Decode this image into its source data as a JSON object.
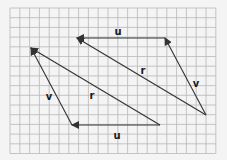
{
  "diagram": {
    "title": "",
    "grid": {
      "x": 10,
      "y": 8,
      "cols": 21,
      "rows": 15,
      "cell_w": 9.8,
      "cell_h": 9.7,
      "color": "#b8b8b8"
    },
    "colors": {
      "background": "#f4f4f4",
      "stroke": "#333333",
      "label": "#1a1a1a"
    },
    "vectors": [
      {
        "id": "u-top",
        "label": "u",
        "from": [
          165,
          38
        ],
        "to": [
          77,
          38
        ],
        "label_pos": [
          118,
          35
        ]
      },
      {
        "id": "r-top",
        "label": "r",
        "from": [
          206,
          115
        ],
        "to": [
          77,
          38
        ],
        "label_pos": [
          143,
          74
        ]
      },
      {
        "id": "v-right",
        "label": "v",
        "from": [
          206,
          115
        ],
        "to": [
          165,
          38
        ],
        "label_pos": [
          196,
          87
        ]
      },
      {
        "id": "r-bottom",
        "label": "r",
        "from": [
          160,
          125
        ],
        "to": [
          31,
          48
        ],
        "label_pos": [
          92,
          99
        ]
      },
      {
        "id": "v-left",
        "label": "v",
        "from": [
          72,
          125
        ],
        "to": [
          31,
          48
        ],
        "label_pos": [
          49,
          100
        ]
      },
      {
        "id": "u-bottom",
        "label": "u",
        "from": [
          160,
          125
        ],
        "to": [
          72,
          125
        ],
        "label_pos": [
          117,
          139
        ]
      }
    ]
  }
}
